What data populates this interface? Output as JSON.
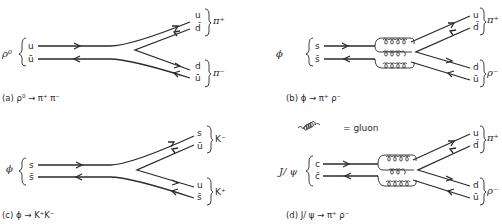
{
  "legend": {
    "gluon_label": "= gluon"
  },
  "panels": [
    {
      "id": "a",
      "parent": "ρ⁰",
      "initial": [
        "u",
        "ū"
      ],
      "products": [
        {
          "name": "π⁺",
          "quarks": [
            "u",
            "d̄"
          ]
        },
        {
          "name": "π⁻",
          "quarks": [
            "d",
            "ū"
          ]
        }
      ],
      "caption": "(a) ρ⁰ → π⁺ π⁻"
    },
    {
      "id": "b",
      "parent": "ϕ",
      "initial": [
        "s",
        "s̄"
      ],
      "products": [
        {
          "name": "π⁺",
          "quarks": [
            "u",
            "d̄"
          ]
        },
        {
          "name": "ρ⁻",
          "quarks": [
            "d",
            "ū"
          ]
        }
      ],
      "caption": "(b) ϕ → π⁺ ρ⁻"
    },
    {
      "id": "c",
      "parent": "ϕ",
      "initial": [
        "s",
        "s̄"
      ],
      "products": [
        {
          "name": "K⁻",
          "quarks": [
            "s",
            "ū"
          ]
        },
        {
          "name": "K⁺",
          "quarks": [
            "u",
            "s̄"
          ]
        }
      ],
      "caption": "(c) ϕ → K⁺K⁻"
    },
    {
      "id": "d",
      "parent": "J/ ψ",
      "initial": [
        "c",
        "c̄"
      ],
      "products": [
        {
          "name": "π⁺",
          "quarks": [
            "u",
            "d̄"
          ]
        },
        {
          "name": "ρ⁻",
          "quarks": [
            "d",
            "ū"
          ]
        }
      ],
      "caption": "(d) J/ ψ → π⁺  ρ⁻"
    }
  ]
}
